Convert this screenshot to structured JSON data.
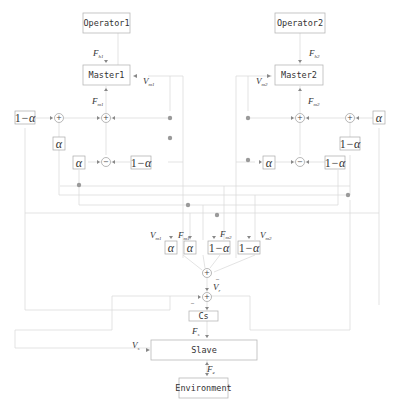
{
  "blocks": {
    "operator1": "Operator1",
    "operator2": "Operator2",
    "master1": "Master1",
    "master2": "Master2",
    "cs": "Cs",
    "slave": "Slave",
    "environment": "Environment"
  },
  "gains": {
    "alpha": "α",
    "one_minus_alpha_one": "1",
    "one_minus_alpha_rest": "−α"
  },
  "signals": {
    "fh1": {
      "main": "F",
      "sub": "h1"
    },
    "fh2": {
      "main": "F",
      "sub": "h2"
    },
    "vm1": {
      "main": "V",
      "sub": "m1"
    },
    "vm2": {
      "main": "V",
      "sub": "m2"
    },
    "fm1": {
      "main": "F",
      "sub": "m1"
    },
    "fm2": {
      "main": "F",
      "sub": "m2"
    },
    "vm1_bottom": {
      "main": "V",
      "sub": "m1"
    },
    "fm1_bottom": {
      "main": "F",
      "sub": "m1"
    },
    "fm2_bottom": {
      "main": "F",
      "sub": "m2"
    },
    "vm2_bottom": {
      "main": "V",
      "sub": "m2"
    },
    "vr": {
      "main": "V",
      "sub": "r"
    },
    "fs": {
      "main": "F",
      "sub": "s"
    },
    "vs": {
      "main": "V",
      "sub": "s"
    },
    "fe": {
      "main": "F",
      "sub": "e"
    }
  },
  "sum_signs": {
    "plus": "+",
    "minus": "−",
    "neg_mark": "_"
  }
}
